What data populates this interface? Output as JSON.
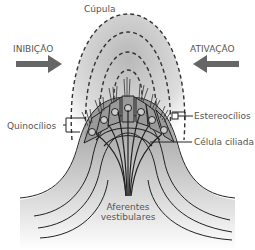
{
  "diagram": {
    "labels": {
      "cupula": "Cúpula",
      "inhibition": "INIBIÇÃO",
      "activation": "ATIVAÇÃO",
      "stereocilia": "Estereocílios",
      "kinocilia": "Quinocílios",
      "hair_cell": "Célula ciliada",
      "afferents_line1": "Aferentes",
      "afferents_line2": "vestibulares"
    },
    "arrows": [
      {
        "name": "inhibition-arrow",
        "direction": "right",
        "color": "#666666"
      },
      {
        "name": "activation-arrow",
        "direction": "left",
        "color": "#666666"
      }
    ],
    "colors": {
      "cupula_gradient_top": "#bdbdbd",
      "cupula_gradient_bottom": "#ffffff",
      "crista_fill": "#8c8c8c",
      "line": "#222222",
      "label_text": "#555555"
    }
  }
}
